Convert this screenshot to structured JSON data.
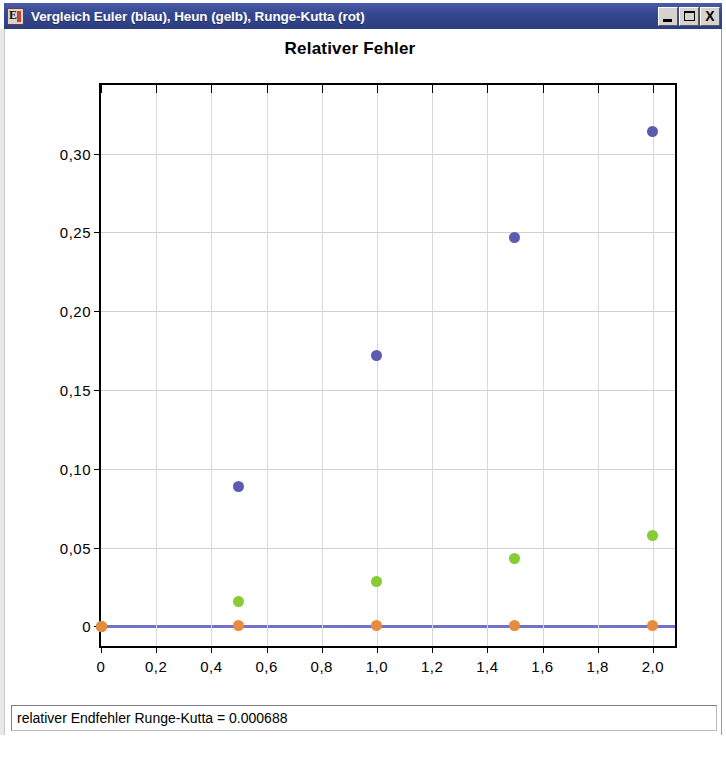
{
  "window": {
    "title": "Vergleich Euler (blau), Heun (gelb), Runge-Kutta (rot)",
    "icon": "java-app-icon",
    "controls": {
      "minimize": "_",
      "maximize": "□",
      "close": "X"
    }
  },
  "status": {
    "text": "relativer Endfehler Runge-Kutta = 0.000688"
  },
  "chart_data": {
    "type": "scatter",
    "title": "Relativer Fehler",
    "xlabel": "",
    "ylabel": "",
    "xlim": [
      0,
      2.08
    ],
    "ylim": [
      -0.0125,
      0.3435
    ],
    "grid": true,
    "legend_position": "none",
    "xticks": [
      0,
      0.2,
      0.4,
      0.6,
      0.8,
      1.0,
      1.2,
      1.4,
      1.6,
      1.8,
      2.0
    ],
    "xticklabels": [
      "0",
      "0,2",
      "0,4",
      "0,6",
      "0,8",
      "1,0",
      "1,2",
      "1,4",
      "1,6",
      "1,8",
      "2,0"
    ],
    "yticks": [
      0,
      0.05,
      0.1,
      0.15,
      0.2,
      0.25,
      0.3
    ],
    "yticklabels": [
      "0",
      "0,05",
      "0,10",
      "0,15",
      "0,20",
      "0,25",
      "0,30"
    ],
    "series": [
      {
        "name": "Euler",
        "color": "#5b5bb0",
        "marker": "circle",
        "x": [
          0,
          0.5,
          1.0,
          1.5,
          2.0
        ],
        "values": [
          0,
          0.089,
          0.172,
          0.247,
          0.314
        ]
      },
      {
        "name": "Heun",
        "color": "#86cc33",
        "marker": "circle",
        "x": [
          0,
          0.5,
          1.0,
          1.5,
          2.0
        ],
        "values": [
          0,
          0.0158,
          0.0285,
          0.0428,
          0.0578
        ]
      },
      {
        "name": "Runge-Kutta",
        "color": "#e98b3d",
        "marker": "circle",
        "x": [
          0,
          0.5,
          1.0,
          1.5,
          2.0
        ],
        "values": [
          0,
          0.0007,
          0.0007,
          0.0007,
          0.0007
        ]
      }
    ],
    "baseline": {
      "color": "#5b5bbf",
      "y": 0
    }
  }
}
